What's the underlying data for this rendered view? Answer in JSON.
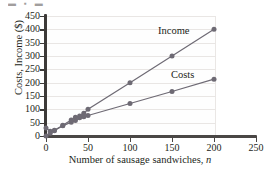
{
  "artifact": {
    "top_strip_text": "▬ ▪ ▬"
  },
  "chart_data": {
    "type": "line",
    "title": "",
    "xlabel": "Number of sausage sandwiches, n",
    "xlabel_main": "Number of sausage sandwiches,",
    "xlabel_italic": "n",
    "ylabel": "Costs, Income ($)",
    "xlim": [
      0,
      250
    ],
    "ylim": [
      0,
      450
    ],
    "xticks": [
      0,
      50,
      100,
      150,
      200,
      250
    ],
    "yticks": [
      0,
      50,
      100,
      150,
      200,
      250,
      300,
      350,
      400,
      450
    ],
    "grid": "horizontal",
    "legend_position": "inline-annotations",
    "series": [
      {
        "name": "Income",
        "color": "#6e6a74",
        "marker": "circle",
        "x": [
          0,
          5,
          10,
          20,
          30,
          35,
          40,
          45,
          50,
          100,
          150,
          200
        ],
        "y": [
          0,
          10,
          20,
          40,
          60,
          70,
          75,
          85,
          100,
          200,
          300,
          400
        ]
      },
      {
        "name": "Costs",
        "color": "#6e6a74",
        "marker": "circle",
        "x": [
          0,
          5,
          10,
          20,
          30,
          35,
          40,
          45,
          50,
          100,
          150,
          200
        ],
        "y": [
          30,
          18,
          22,
          38,
          52,
          58,
          68,
          72,
          77,
          122,
          167,
          213
        ]
      }
    ],
    "annotations": [
      {
        "text": "Income",
        "x": 150,
        "y": 395
      },
      {
        "text": "Costs",
        "x": 170,
        "y": 230
      }
    ]
  },
  "axis_labels": {
    "y": [
      "450",
      "400",
      "350",
      "300",
      "250",
      "200",
      "150",
      "100",
      "50",
      "0"
    ],
    "x": [
      "0",
      "50",
      "100",
      "150",
      "200",
      "250"
    ]
  }
}
